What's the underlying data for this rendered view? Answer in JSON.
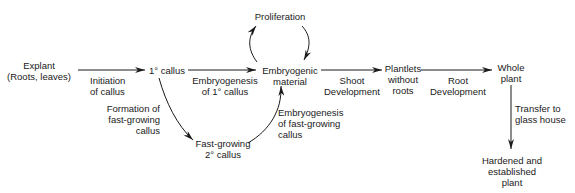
{
  "diagram": {
    "type": "flowchart",
    "nodes": [
      {
        "id": "explant",
        "label": "Explant\n(Roots, leaves)"
      },
      {
        "id": "callus1",
        "label": "1° callus"
      },
      {
        "id": "embryogenic",
        "label": "Embryogenic\nmaterial"
      },
      {
        "id": "proliferation",
        "label": "Proliferation"
      },
      {
        "id": "callus2",
        "label": "Fast-growing\n2° callus"
      },
      {
        "id": "plantlets",
        "label": "Plantlets\nwithout\nroots"
      },
      {
        "id": "whole",
        "label": "Whole\nplant"
      },
      {
        "id": "hardened",
        "label": "Hardened and\nestablished\nplant"
      }
    ],
    "edges": [
      {
        "from": "explant",
        "to": "callus1",
        "label": "Initiation\nof callus"
      },
      {
        "from": "callus1",
        "to": "embryogenic",
        "label": "Embryogenesis\nof 1° callus"
      },
      {
        "from": "callus1",
        "to": "callus2",
        "label": "Formation of\nfast-growing\ncallus"
      },
      {
        "from": "callus2",
        "to": "embryogenic",
        "label": "Embryogenesis\nof fast-growing\ncallus"
      },
      {
        "from": "embryogenic",
        "to": "proliferation",
        "label": ""
      },
      {
        "from": "proliferation",
        "to": "embryogenic",
        "label": ""
      },
      {
        "from": "embryogenic",
        "to": "plantlets",
        "label": "Shoot\nDevelopment"
      },
      {
        "from": "plantlets",
        "to": "whole",
        "label": "Root\nDevelopment"
      },
      {
        "from": "whole",
        "to": "hardened",
        "label": "Transfer to\nglass house"
      }
    ]
  }
}
